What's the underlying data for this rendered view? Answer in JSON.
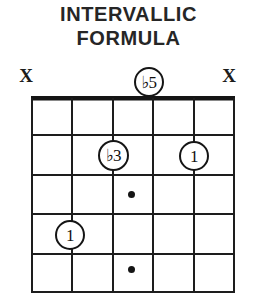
{
  "title": {
    "line1": "INTERVALLIC",
    "line2": "FORMULA"
  },
  "diagram": {
    "type": "guitar-chord-diagram",
    "string_count": 6,
    "fret_count": 5,
    "nut_shown": true,
    "colors": {
      "ink": "#151515",
      "paper": "#ffffff"
    },
    "muted_strings": [
      {
        "id": "x-left",
        "label": "X",
        "string": 6
      },
      {
        "id": "x-right",
        "label": "X",
        "string": 1
      }
    ],
    "degrees": [
      {
        "id": "b5",
        "label_accidental": "♭",
        "label_number": "5",
        "string": 3,
        "fret": 0,
        "position": "above-nut"
      },
      {
        "id": "b3",
        "label_accidental": "♭",
        "label_number": "3",
        "string": 4,
        "fret": 2,
        "position": "on-string"
      },
      {
        "id": "r1",
        "label_accidental": "",
        "label_number": "1",
        "string": 2,
        "fret": 2,
        "position": "on-string"
      },
      {
        "id": "r2",
        "label_accidental": "",
        "label_number": "1",
        "string": 5,
        "fret": 4,
        "position": "on-string"
      }
    ],
    "fret_markers": [
      {
        "id": "dot-f3",
        "fret": 3,
        "between_strings": "3-4"
      },
      {
        "id": "dot-f5",
        "fret": 5,
        "between_strings": "3-4"
      }
    ]
  }
}
